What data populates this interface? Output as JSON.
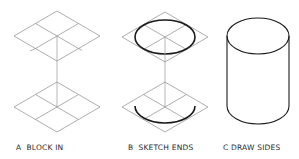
{
  "diagram": {
    "type": "cylinder_sketch_steps",
    "steps": [
      {
        "id": "A",
        "label": "A  BLOCK IN"
      },
      {
        "id": "B",
        "label": "B  SKETCH ENDS"
      },
      {
        "id": "C",
        "label": "C DRAW SIDES"
      }
    ],
    "colors": {
      "construction_line": "#8a8a8a",
      "object_line": "#1a1a1a",
      "label_text": "#2a2a2a",
      "background": "#ffffff"
    }
  }
}
